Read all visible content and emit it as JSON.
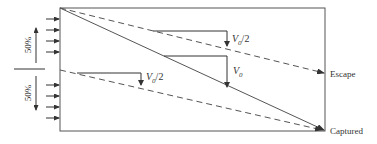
{
  "diagram": {
    "type": "particle-capture-settling-chamber",
    "colors": {
      "line": "#555555",
      "text": "#333333",
      "background": "#ffffff"
    },
    "inlet": {
      "upper_fraction_label": "50%",
      "lower_fraction_label": "50%",
      "arrows_per_half": 4
    },
    "brackets": {
      "upper_half_label_main": "V",
      "upper_half_label_sub": "0",
      "upper_half_label_suffix": "/2",
      "full_label_main": "V",
      "full_label_sub": "0",
      "lower_half_label_main": "V",
      "lower_half_label_sub": "0",
      "lower_half_label_suffix": "/2"
    },
    "outlets": {
      "escape_label": "Escape",
      "captured_label": "Captured"
    }
  }
}
